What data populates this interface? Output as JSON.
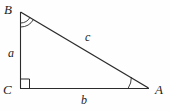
{
  "figure": {
    "kind": "right-triangle-diagram",
    "background_color": "#fefefe",
    "stroke_color": "#2b2b2b",
    "vertices": {
      "B": {
        "label": "B",
        "x": 20,
        "y": 12,
        "angle_mark": "double-arc"
      },
      "C": {
        "label": "C",
        "x": 21,
        "y": 88,
        "angle_mark": "right-angle-square"
      },
      "A": {
        "label": "A",
        "x": 148,
        "y": 88,
        "angle_mark": "single-arc"
      }
    },
    "sides": {
      "a": {
        "label": "a",
        "from": "B",
        "to": "C",
        "description": "vertical leg"
      },
      "b": {
        "label": "b",
        "from": "C",
        "to": "A",
        "description": "horizontal leg"
      },
      "c": {
        "label": "c",
        "from": "B",
        "to": "A",
        "description": "hypotenuse"
      }
    }
  }
}
